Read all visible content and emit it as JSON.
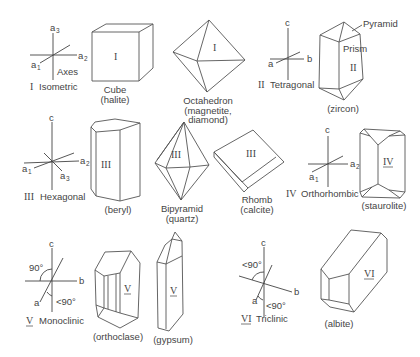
{
  "systems": [
    {
      "numeral": "I",
      "name": "Isometric",
      "axes": {
        "a1": "a",
        "a1_sub": "1",
        "a2": "a",
        "a2_sub": "2",
        "a3": "a",
        "a3_sub": "3"
      },
      "axes_label": "Axes",
      "crystals": [
        {
          "numeral": "I",
          "name": "Cube",
          "mineral": "(halite)"
        },
        {
          "numeral": "I",
          "name": "Octahedron",
          "mineral_line1": "(magnetite,",
          "mineral_line2": "diamond)"
        }
      ]
    },
    {
      "numeral": "II",
      "name": "Tetragonal",
      "axes": {
        "a": "a",
        "b": "b",
        "c": "c"
      },
      "crystals": [
        {
          "numeral": "II",
          "face_labels": [
            "Pyramid",
            "Prism"
          ],
          "mineral": "(zircon)"
        }
      ]
    },
    {
      "numeral": "III",
      "name": "Hexagonal",
      "axes": {
        "a1": "a",
        "a1_sub": "1",
        "a2": "a",
        "a2_sub": "2",
        "a3": "a",
        "a3_sub": "3",
        "c": "c"
      },
      "crystals": [
        {
          "numeral": "III",
          "mineral": "(beryl)"
        },
        {
          "numeral": "III",
          "name": "Bipyramid",
          "mineral": "(quartz)"
        },
        {
          "numeral": "III",
          "name": "Rhomb",
          "mineral": "(calcite)"
        }
      ]
    },
    {
      "numeral": "IV",
      "name": "Orthorhombic",
      "axes": {
        "a1": "a",
        "a1_sub": "1",
        "a2": "a",
        "a2_sub": "2",
        "c": "c"
      },
      "crystals": [
        {
          "numeral": "IV",
          "mineral": "(staurolite)"
        }
      ]
    },
    {
      "numeral": "V",
      "name": "Monoclinic",
      "axes": {
        "a": "a",
        "b": "b",
        "c": "c",
        "angle_top": "90°",
        "angle_bottom": "<90°"
      },
      "crystals": [
        {
          "numeral": "V",
          "mineral": "(orthoclase)"
        },
        {
          "numeral": "V",
          "mineral": "(gypsum)"
        }
      ]
    },
    {
      "numeral": "VI",
      "name": "Triclinic",
      "axes": {
        "a": "a",
        "b": "b",
        "c": "c",
        "angle_top": "<90°",
        "angle_bottom": "<90°"
      },
      "crystals": [
        {
          "numeral": "VI",
          "mineral": "(albite)"
        }
      ]
    }
  ]
}
